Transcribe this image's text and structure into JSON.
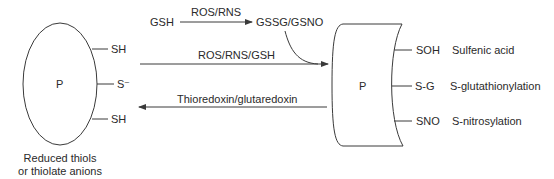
{
  "diagram": {
    "left_protein": {
      "label": "P",
      "groups": [
        "SH",
        "S⁻",
        "SH"
      ],
      "caption_line1": "Reduced thiols",
      "caption_line2": "or thiolate anions"
    },
    "right_protein": {
      "label": "P",
      "groups": [
        {
          "group": "SOH",
          "name": "Sulfenic acid"
        },
        {
          "group": "S-G",
          "name": "S-glutathionylation"
        },
        {
          "group": "SNO",
          "name": "S-nitrosylation"
        }
      ]
    },
    "top_reaction": {
      "reactant": "GSH",
      "arrow_label": "ROS/RNS",
      "product": "GSSG/GSNO"
    },
    "forward_arrow_label": "ROS/RNS/GSH",
    "reverse_arrow_label": "Thioredoxin/glutaredoxin",
    "colors": {
      "line": "#3a3a3a",
      "text": "#2a2a2a",
      "background": "#ffffff"
    }
  }
}
